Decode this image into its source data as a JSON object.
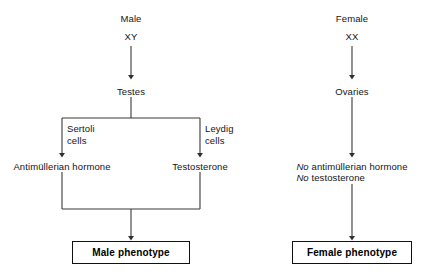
{
  "diagram": {
    "background_color": "#ffffff",
    "line_color": "#3a3a3a",
    "text_color": "#141414",
    "box_border_color": "#111111"
  },
  "male_branch": {
    "sex_label": "Male",
    "karyotype": "XY",
    "gonad": "Testes",
    "cell_type_left": "Sertoli\ncells",
    "cell_type_right": "Leydig\ncells",
    "hormone_left": "Antimüllerian hormone",
    "hormone_right": "Testosterone",
    "outcome": "Male phenotype"
  },
  "female_branch": {
    "sex_label": "Female",
    "karyotype": "XX",
    "gonad": "Ovaries",
    "absent_hormone_1_prefix": "No",
    "absent_hormone_1_rest": " antimüllerian hormone",
    "absent_hormone_2_prefix": "No",
    "absent_hormone_2_rest": " testosterone",
    "outcome": "Female phenotype"
  }
}
